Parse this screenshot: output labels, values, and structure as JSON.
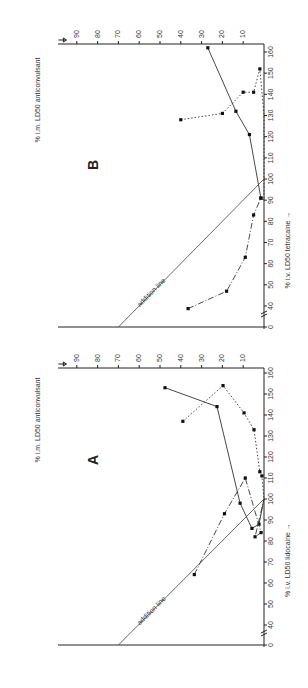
{
  "figure": {
    "panels": [
      {
        "id": "A",
        "label": "A"
      },
      {
        "id": "B",
        "label": "B"
      }
    ]
  },
  "chart_data": [
    {
      "type": "line",
      "title": "A",
      "xlabel": "% i.v. LD50 lidocaine",
      "ylabel": "% i.m. LD50 anticonvulsant",
      "x_ticks": [
        0,
        40,
        50,
        60,
        70,
        80,
        90,
        100,
        110,
        120,
        130,
        140,
        150,
        160
      ],
      "y_ticks": [
        10,
        20,
        30,
        40,
        50,
        60,
        70,
        80,
        90
      ],
      "xlim": [
        0,
        160
      ],
      "ylim": [
        0,
        90
      ],
      "axis_break": "x between 0 and 40",
      "annotations": [
        {
          "text": "addition line",
          "from": [
            0,
            70
          ],
          "to": [
            100,
            0
          ]
        }
      ],
      "series": [
        {
          "name": "solid",
          "style": "solid",
          "points": [
            [
              153,
              47.6
            ],
            [
              144,
              22.6
            ],
            [
              98,
              11.5
            ],
            [
              86,
              5.8
            ],
            [
              88,
              2.4
            ],
            [
              100,
              0
            ]
          ]
        },
        {
          "name": "dotted",
          "style": "dotted",
          "points": [
            [
              137,
              39
            ],
            [
              154,
              19.7
            ],
            [
              141,
              9.6
            ],
            [
              133,
              4.8
            ],
            [
              113,
              2
            ],
            [
              111,
              1
            ],
            [
              100,
              0
            ]
          ]
        },
        {
          "name": "dash-dot",
          "style": "dashdot",
          "points": [
            [
              64,
              33.5
            ],
            [
              93,
              19
            ],
            [
              110,
              9
            ],
            [
              84,
              1.4
            ],
            [
              82,
              4.3
            ],
            [
              100,
              0
            ]
          ]
        }
      ]
    },
    {
      "type": "line",
      "title": "B",
      "xlabel": "% i.v. LD50 tetracaine",
      "ylabel": "% i.m. LD50 anticonvulsant",
      "x_ticks": [
        0,
        40,
        50,
        60,
        70,
        80,
        90,
        100,
        110,
        120,
        130,
        140,
        150,
        160
      ],
      "y_ticks": [
        10,
        20,
        30,
        40,
        50,
        60,
        70,
        80,
        90
      ],
      "xlim": [
        0,
        160
      ],
      "ylim": [
        0,
        90
      ],
      "axis_break": "x between 0 and 40",
      "annotations": [
        {
          "text": "addition line",
          "from": [
            0,
            70
          ],
          "to": [
            100,
            0
          ]
        }
      ],
      "series": [
        {
          "name": "solid",
          "style": "solid",
          "points": [
            [
              162,
              27
            ],
            [
              132,
              13.5
            ],
            [
              121,
              7
            ],
            [
              91,
              1.5
            ],
            [
              90,
              0
            ]
          ]
        },
        {
          "name": "dotted",
          "style": "dotted",
          "points": [
            [
              128,
              40
            ],
            [
              131,
              20
            ],
            [
              141,
              10
            ],
            [
              141,
              5
            ],
            [
              152,
              2
            ],
            [
              130,
              0
            ],
            [
              90,
              0
            ]
          ]
        },
        {
          "name": "dash-dot",
          "style": "dashdot",
          "points": [
            [
              35,
              36.5
            ],
            [
              47,
              18
            ],
            [
              63,
              9
            ],
            [
              83,
              5
            ],
            [
              91,
              1.5
            ]
          ]
        }
      ]
    }
  ]
}
